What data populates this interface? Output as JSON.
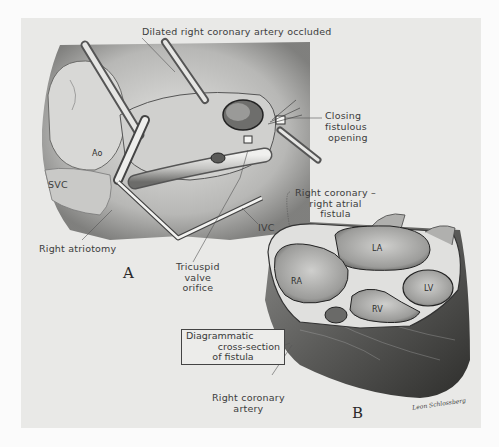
{
  "figure": {
    "panels": [
      {
        "id": "A",
        "letter": "A",
        "description": "Surgical view through right atriotomy"
      },
      {
        "id": "B",
        "letter": "B",
        "description": "Heart cross-section"
      }
    ],
    "labels": {
      "top": "Dilated right coronary artery occluded",
      "closing": [
        "Closing",
        "fistulous",
        "opening"
      ],
      "fistula": [
        "Right coronary –",
        "right atrial",
        "fistula"
      ],
      "ao": "Ao",
      "svc": "SVC",
      "ivc": "IVC",
      "atriotomy": "Right atriotomy",
      "tricuspid": [
        "Tricuspid",
        "valve",
        "orifice"
      ],
      "diagram_box": [
        "Diagrammatic",
        "cross-section",
        "of fistula"
      ],
      "rca": [
        "Right coronary",
        "artery"
      ],
      "chambers": {
        "la": "LA",
        "ra": "RA",
        "lv": "LV",
        "rv": "RV"
      }
    },
    "signature": "Leon Schlossberg",
    "colors": {
      "page": "#fbfbfb",
      "plate": "#e9e9e7",
      "ink": "#3c3c3c",
      "tissue_light": "#d4d4d2",
      "tissue_mid": "#a8a8a6",
      "tissue_dark": "#4a4a4a"
    }
  }
}
